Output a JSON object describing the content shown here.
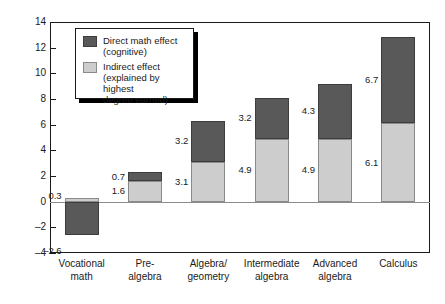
{
  "chart_data": {
    "type": "bar",
    "stacked": true,
    "title": "",
    "xlabel": "",
    "ylabel": "Percentage",
    "ylim": [
      -4,
      14
    ],
    "ytick_values": [
      14,
      12,
      10,
      8,
      6,
      4,
      2,
      0,
      -2,
      -4
    ],
    "ytick_labels": [
      "14",
      "12",
      "10",
      "8",
      "6",
      "4",
      "2",
      "0",
      "–2",
      "–4"
    ],
    "grid": false,
    "legend_position": "upper-left-inside",
    "categories": [
      "Vocational math",
      "Pre-algebra",
      "Algebra/geometry",
      "Intermediate algebra",
      "Advanced algebra",
      "Calculus"
    ],
    "category_label_lines": [
      [
        "Vocational",
        "math"
      ],
      [
        "Pre-",
        "algebra"
      ],
      [
        "Algebra/",
        "geometry"
      ],
      [
        "Intermediate",
        "algebra"
      ],
      [
        "Advanced",
        "algebra"
      ],
      [
        "Calculus"
      ]
    ],
    "series": [
      {
        "name": "Indirect effect (explained by highest degree earned)",
        "color": "#cdcdcd",
        "values": [
          0.3,
          1.6,
          3.1,
          4.9,
          4.9,
          6.1
        ],
        "labels": [
          "0.3",
          "1.6",
          "3.1",
          "4.9",
          "4.9",
          "6.1"
        ]
      },
      {
        "name": "Direct math effect (cognitive)",
        "color": "#595959",
        "values": [
          -2.6,
          0.7,
          3.2,
          3.2,
          4.3,
          6.7
        ],
        "labels": [
          "–2.6",
          "0.7",
          "3.2",
          "3.2",
          "4.3",
          "6.7"
        ]
      }
    ]
  },
  "legend": {
    "entries": [
      {
        "swatch": "direct",
        "line1": "Direct math effect",
        "line2": "(cognitive)"
      },
      {
        "swatch": "indirect",
        "line1": "Indirect effect",
        "line2": "(explained by highest",
        "line3": "degree earned)"
      }
    ]
  }
}
